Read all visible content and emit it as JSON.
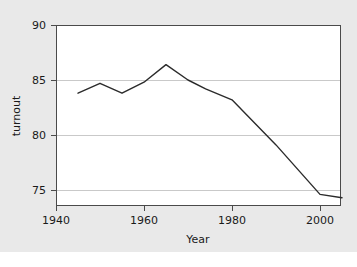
{
  "figure": {
    "background_color": "#e9e9e9",
    "plot_background_color": "#ffffff",
    "line_color": "#2b2b2b",
    "grid_color": "#c9c9c9",
    "axis_color": "#4a4a4a"
  },
  "axes": {
    "x_title": "Year",
    "y_title": "turnout",
    "x_ticks": [
      "1940",
      "1960",
      "1980",
      "2000"
    ],
    "y_ticks": [
      "90",
      "85",
      "80",
      "75"
    ]
  },
  "chart_data": {
    "type": "line",
    "title": "",
    "xlabel": "Year",
    "ylabel": "turnout",
    "xlim": [
      1938,
      2007
    ],
    "ylim": [
      73.5,
      90.8
    ],
    "xticks": [
      1940,
      1960,
      1980,
      2000
    ],
    "yticks": [
      75,
      80,
      85,
      90
    ],
    "grid": "horizontal",
    "legend": "none",
    "series": [
      {
        "name": "turnout",
        "x": [
          1945,
          1950,
          1955,
          1960,
          1965,
          1970,
          1974,
          1980,
          1990,
          2000,
          2005
        ],
        "values": [
          83.8,
          84.7,
          83.8,
          84.8,
          86.4,
          85.0,
          84.2,
          83.2,
          79.1,
          74.6,
          74.3
        ]
      }
    ]
  }
}
